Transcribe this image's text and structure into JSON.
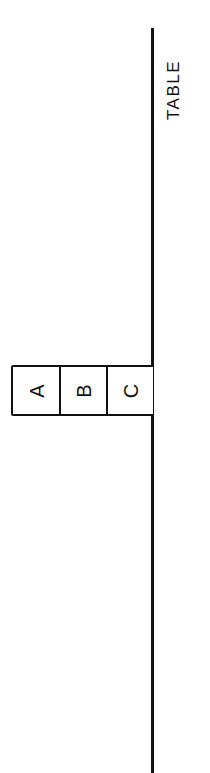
{
  "diagram": {
    "type": "blocks-world",
    "orientation": "rotated -90 degrees",
    "surface": {
      "label": "TABLE"
    },
    "blocks": [
      {
        "id": "A",
        "label": "A",
        "position": "top"
      },
      {
        "id": "B",
        "label": "B",
        "position": "middle"
      },
      {
        "id": "C",
        "label": "C",
        "position": "bottom",
        "on": "TABLE"
      }
    ],
    "colors": {
      "ink": "#111111",
      "background": "#ffffff"
    }
  }
}
